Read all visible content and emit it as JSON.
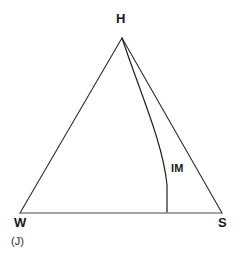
{
  "figure": {
    "caption": "(J)",
    "stroke_color": "#2b2b2b",
    "background_color": "#ffffff",
    "vertices": [
      {
        "name": "H",
        "label": "H",
        "x": 122,
        "y": 38
      },
      {
        "name": "W",
        "label": "W",
        "x": 20,
        "y": 213
      },
      {
        "name": "S",
        "label": "S",
        "x": 222,
        "y": 213
      }
    ],
    "curve": {
      "label": "IM",
      "start_x": 122,
      "start_y": 38,
      "end_x": 167,
      "end_y": 212
    }
  }
}
